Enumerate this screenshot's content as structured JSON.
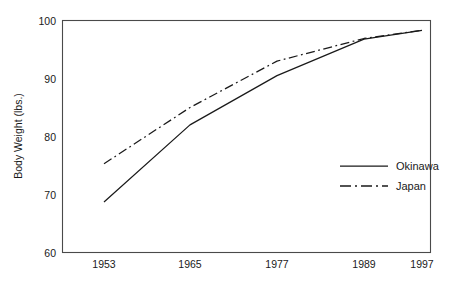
{
  "chart_data": {
    "type": "line",
    "title": "",
    "xlabel": "",
    "ylabel": "Body Weight (lbs.)",
    "x": [
      1953,
      1965,
      1977,
      1989,
      1997
    ],
    "categories": [
      "1953",
      "1965",
      "1977",
      "1989",
      "1997"
    ],
    "xtick_labels": [
      "1953",
      "1965",
      "1977",
      "1989",
      "1997"
    ],
    "ytick_labels": [
      "100",
      "90",
      "80",
      "70",
      "60"
    ],
    "yticks": [
      100,
      90,
      80,
      70,
      60
    ],
    "ylim": [
      60,
      100
    ],
    "xlim": [
      1949,
      2000
    ],
    "grid": false,
    "legend_position": "inside-right",
    "series": [
      {
        "name": "Okinawa",
        "style": "solid",
        "color": "#1a1a1a",
        "x": [
          1953,
          1965,
          1977,
          1989,
          1997
        ],
        "values": [
          68.7,
          82.0,
          90.5,
          96.8,
          98.3
        ]
      },
      {
        "name": "Japan",
        "style": "dash-dot",
        "color": "#1a1a1a",
        "x": [
          1953,
          1965,
          1977,
          1989,
          1997
        ],
        "values": [
          75.3,
          85.0,
          93.0,
          96.9,
          98.3
        ]
      }
    ]
  },
  "axes": {
    "y_axis_title": "Body Weight (lbs.)",
    "y_ticks": [
      {
        "label": "100",
        "value": 100
      },
      {
        "label": "90",
        "value": 90
      },
      {
        "label": "80",
        "value": 80
      },
      {
        "label": "70",
        "value": 70
      },
      {
        "label": "60",
        "value": 60
      }
    ],
    "x_ticks": [
      {
        "label": "1953",
        "value": 1953
      },
      {
        "label": "1965",
        "value": 1965
      },
      {
        "label": "1977",
        "value": 1977
      },
      {
        "label": "1989",
        "value": 1989
      },
      {
        "label": "1997",
        "value": 1997
      }
    ]
  },
  "legend": {
    "entries": [
      {
        "label": "Okinawa",
        "style": "solid"
      },
      {
        "label": "Japan",
        "style": "dash-dot"
      }
    ]
  },
  "colors": {
    "line": "#1a1a1a",
    "frame": "#4a4a4a",
    "background": "#ffffff",
    "text": "#1a1a1a"
  }
}
